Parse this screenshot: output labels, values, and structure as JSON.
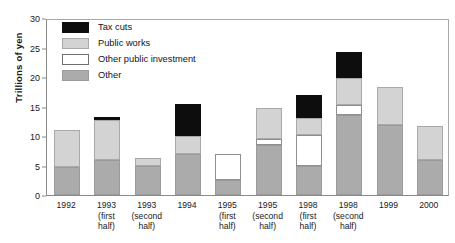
{
  "chart_data": {
    "type": "bar",
    "stacked": true,
    "title": "",
    "xlabel": "",
    "ylabel": "Trillions of yen",
    "ylim": [
      0,
      30
    ],
    "yticks": [
      0,
      5,
      10,
      15,
      20,
      25,
      30
    ],
    "grid": false,
    "legend_position": "top-left",
    "categories": [
      "1992",
      "1993 (first half)",
      "1993 (second half)",
      "1994",
      "1995 (first half)",
      "1995 (second half)",
      "1998 (first half)",
      "1998 (second half)",
      "1999",
      "2000"
    ],
    "category_lines": [
      [
        "1992"
      ],
      [
        "1993",
        "(first",
        "half)"
      ],
      [
        "1993",
        "(second",
        "half)"
      ],
      [
        "1994"
      ],
      [
        "1995",
        "(first",
        "half)"
      ],
      [
        "1995",
        "(second",
        "half)"
      ],
      [
        "1998",
        "(first",
        "half)"
      ],
      [
        "1998",
        "(second",
        "half)"
      ],
      [
        "1999"
      ],
      [
        "2000"
      ]
    ],
    "series": [
      {
        "name": "Other",
        "color": "#ababab",
        "values": [
          4.7,
          6.0,
          5.0,
          7.0,
          2.5,
          8.5,
          5.0,
          13.6,
          11.8,
          6.0
        ]
      },
      {
        "name": "Other public investment",
        "color": "#ffffff",
        "values": [
          0.0,
          0.0,
          0.0,
          0.0,
          4.5,
          1.0,
          5.2,
          1.6,
          0.0,
          0.0
        ]
      },
      {
        "name": "Public works",
        "color": "#d3d3d3",
        "values": [
          6.3,
          6.7,
          1.2,
          3.0,
          0.0,
          5.2,
          2.9,
          4.6,
          6.5,
          5.7
        ]
      },
      {
        "name": "Tax cuts",
        "color": "#0d0d0d",
        "values": [
          0.0,
          0.5,
          0.0,
          5.5,
          0.0,
          0.0,
          3.9,
          4.4,
          0.0,
          0.0
        ]
      }
    ],
    "totals": [
      11.0,
      13.2,
      6.2,
      15.5,
      7.0,
      14.7,
      17.0,
      24.2,
      18.3,
      11.7
    ]
  },
  "legend": {
    "items": [
      {
        "label": "Tax cuts",
        "swatch": "tax"
      },
      {
        "label": "Public works",
        "swatch": "pw"
      },
      {
        "label": "Other public investment",
        "swatch": "opi"
      },
      {
        "label": "Other",
        "swatch": "other"
      }
    ]
  }
}
